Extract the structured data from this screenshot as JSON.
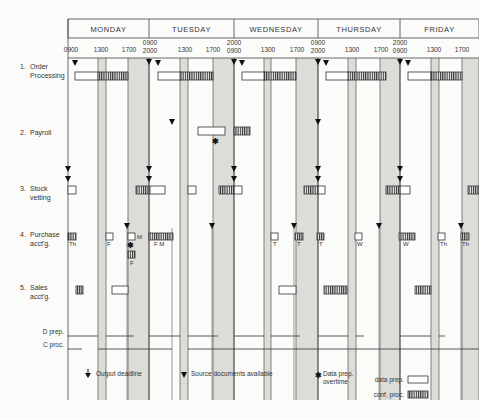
{
  "days": [
    {
      "label": "MONDAY",
      "x0": 68,
      "x1": 149
    },
    {
      "label": "TUESDAY",
      "x0": 149,
      "x1": 234
    },
    {
      "label": "WEDNESDAY",
      "x0": 234,
      "x1": 318
    },
    {
      "label": "THURSDAY",
      "x0": 318,
      "x1": 400
    },
    {
      "label": "FRIDAY",
      "x0": 400,
      "x1": 479
    }
  ],
  "time_labels": [
    {
      "x": 71,
      "y": 52,
      "text": "0900"
    },
    {
      "x": 101,
      "y": 52,
      "text": "1300"
    },
    {
      "x": 129,
      "y": 52,
      "text": "1700"
    },
    {
      "x": 150,
      "y": 45,
      "text": "0900"
    },
    {
      "x": 150,
      "y": 53,
      "text": "2000"
    },
    {
      "x": 185,
      "y": 52,
      "text": "1300"
    },
    {
      "x": 213,
      "y": 52,
      "text": "1700"
    },
    {
      "x": 234,
      "y": 45,
      "text": "2000"
    },
    {
      "x": 234,
      "y": 53,
      "text": "0900"
    },
    {
      "x": 268,
      "y": 52,
      "text": "1300"
    },
    {
      "x": 297,
      "y": 52,
      "text": "1700"
    },
    {
      "x": 318,
      "y": 45,
      "text": "0900"
    },
    {
      "x": 318,
      "y": 53,
      "text": "2000"
    },
    {
      "x": 352,
      "y": 52,
      "text": "1300"
    },
    {
      "x": 381,
      "y": 52,
      "text": "1700"
    },
    {
      "x": 400,
      "y": 45,
      "text": "2000"
    },
    {
      "x": 400,
      "y": 53,
      "text": "0900"
    },
    {
      "x": 434,
      "y": 52,
      "text": "1300"
    },
    {
      "x": 462,
      "y": 52,
      "text": "1700"
    }
  ],
  "shaded_bands": [
    {
      "x0": 98,
      "x1": 106
    },
    {
      "x0": 128,
      "x1": 149
    },
    {
      "x0": 180,
      "x1": 188
    },
    {
      "x0": 213,
      "x1": 234
    },
    {
      "x0": 264,
      "x1": 271
    },
    {
      "x0": 296,
      "x1": 318
    },
    {
      "x0": 348,
      "x1": 356
    },
    {
      "x0": 380,
      "x1": 400
    },
    {
      "x0": 431,
      "x1": 439
    },
    {
      "x0": 462,
      "x1": 479
    }
  ],
  "rows": [
    {
      "num": "1.",
      "line1": "Order",
      "line2": "Processing",
      "y": 66
    },
    {
      "num": "2.",
      "line1": "Payroll",
      "line2": "",
      "y": 132
    },
    {
      "num": "3.",
      "line1": "Stock",
      "line2": "vetting",
      "y": 188
    },
    {
      "num": "4.",
      "line1": "Purchase",
      "line2": "acct'g.",
      "y": 234
    },
    {
      "num": "5.",
      "line1": "Sales",
      "line2": "acct'g.",
      "y": 287
    }
  ],
  "resource_rows": [
    {
      "label": "D prep.",
      "y": 336
    },
    {
      "label": "C proc.",
      "y": 349
    }
  ],
  "data_prep_boxes": [
    {
      "x": 75,
      "y": 72,
      "w": 23,
      "h": 8
    },
    {
      "x": 158,
      "y": 72,
      "w": 23,
      "h": 8
    },
    {
      "x": 242,
      "y": 72,
      "w": 23,
      "h": 8
    },
    {
      "x": 326,
      "y": 72,
      "w": 23,
      "h": 8
    },
    {
      "x": 408,
      "y": 72,
      "w": 23,
      "h": 8
    },
    {
      "x": 198,
      "y": 127,
      "w": 27,
      "h": 8
    },
    {
      "x": 68,
      "y": 186,
      "w": 8,
      "h": 8
    },
    {
      "x": 150,
      "y": 186,
      "w": 15,
      "h": 8
    },
    {
      "x": 188,
      "y": 186,
      "w": 8,
      "h": 8
    },
    {
      "x": 234,
      "y": 186,
      "w": 8,
      "h": 8
    },
    {
      "x": 318,
      "y": 186,
      "w": 7,
      "h": 8
    },
    {
      "x": 400,
      "y": 186,
      "w": 10,
      "h": 8
    },
    {
      "x": 106,
      "y": 233,
      "w": 7,
      "h": 7
    },
    {
      "x": 128,
      "y": 233,
      "w": 7,
      "h": 7
    },
    {
      "x": 271,
      "y": 233,
      "w": 7,
      "h": 7
    },
    {
      "x": 355,
      "y": 233,
      "w": 7,
      "h": 7
    },
    {
      "x": 438,
      "y": 233,
      "w": 7,
      "h": 7
    },
    {
      "x": 112,
      "y": 286,
      "w": 16,
      "h": 8
    },
    {
      "x": 279,
      "y": 286,
      "w": 17,
      "h": 8
    }
  ],
  "conf_proc_boxes": [
    {
      "x": 98,
      "y": 72,
      "w": 30,
      "h": 8
    },
    {
      "x": 180,
      "y": 72,
      "w": 33,
      "h": 8
    },
    {
      "x": 264,
      "y": 72,
      "w": 32,
      "h": 8
    },
    {
      "x": 348,
      "y": 72,
      "w": 38,
      "h": 8
    },
    {
      "x": 431,
      "y": 72,
      "w": 31,
      "h": 8
    },
    {
      "x": 234,
      "y": 127,
      "w": 16,
      "h": 8
    },
    {
      "x": 136,
      "y": 186,
      "w": 13,
      "h": 8
    },
    {
      "x": 219,
      "y": 186,
      "w": 15,
      "h": 8
    },
    {
      "x": 304,
      "y": 186,
      "w": 14,
      "h": 8
    },
    {
      "x": 386,
      "y": 186,
      "w": 14,
      "h": 8
    },
    {
      "x": 468,
      "y": 186,
      "w": 11,
      "h": 8
    },
    {
      "x": 68,
      "y": 233,
      "w": 8,
      "h": 7
    },
    {
      "x": 149,
      "y": 233,
      "w": 24,
      "h": 7
    },
    {
      "x": 128,
      "y": 251,
      "w": 7,
      "h": 7
    },
    {
      "x": 295,
      "y": 233,
      "w": 8,
      "h": 7
    },
    {
      "x": 317,
      "y": 233,
      "w": 7,
      "h": 7
    },
    {
      "x": 399,
      "y": 233,
      "w": 16,
      "h": 7
    },
    {
      "x": 461,
      "y": 233,
      "w": 8,
      "h": 7
    },
    {
      "x": 76,
      "y": 286,
      "w": 7,
      "h": 8
    },
    {
      "x": 324,
      "y": 286,
      "w": 23,
      "h": 8
    },
    {
      "x": 415,
      "y": 286,
      "w": 16,
      "h": 8
    }
  ],
  "box_labels": [
    {
      "x": 69,
      "y": 246,
      "text": "Th"
    },
    {
      "x": 107,
      "y": 246,
      "text": "F"
    },
    {
      "x": 137,
      "y": 239,
      "text": "M"
    },
    {
      "x": 154,
      "y": 246,
      "text": "F M"
    },
    {
      "x": 130,
      "y": 265,
      "text": "F"
    },
    {
      "x": 273,
      "y": 246,
      "text": "T"
    },
    {
      "x": 297,
      "y": 246,
      "text": "T"
    },
    {
      "x": 319,
      "y": 246,
      "text": "T"
    },
    {
      "x": 357,
      "y": 246,
      "text": "W"
    },
    {
      "x": 403,
      "y": 246,
      "text": "W"
    },
    {
      "x": 440,
      "y": 246,
      "text": "Th"
    },
    {
      "x": 462,
      "y": 246,
      "text": "Th"
    }
  ],
  "source_triangles": [
    {
      "x": 75,
      "y": 63
    },
    {
      "x": 158,
      "y": 63
    },
    {
      "x": 242,
      "y": 63
    },
    {
      "x": 326,
      "y": 63
    },
    {
      "x": 408,
      "y": 63
    },
    {
      "x": 172,
      "y": 122
    },
    {
      "x": 127,
      "y": 226
    },
    {
      "x": 212,
      "y": 226
    },
    {
      "x": 294,
      "y": 226
    },
    {
      "x": 379,
      "y": 226
    },
    {
      "x": 461,
      "y": 226
    }
  ],
  "deadline_lines": [
    {
      "x": 68,
      "y0": 58,
      "y1": 400
    },
    {
      "x": 149,
      "y0": 58,
      "y1": 400
    },
    {
      "x": 234,
      "y0": 58,
      "y1": 400
    },
    {
      "x": 318,
      "y0": 58,
      "y1": 400
    },
    {
      "x": 400,
      "y0": 58,
      "y1": 400
    }
  ],
  "deadline_arrows": [
    {
      "x": 149,
      "y": 62
    },
    {
      "x": 234,
      "y": 62
    },
    {
      "x": 318,
      "y": 62
    },
    {
      "x": 400,
      "y": 62
    },
    {
      "x": 318,
      "y": 122
    },
    {
      "x": 68,
      "y": 169
    },
    {
      "x": 68,
      "y": 179
    },
    {
      "x": 149,
      "y": 169
    },
    {
      "x": 149,
      "y": 179
    },
    {
      "x": 234,
      "y": 169
    },
    {
      "x": 234,
      "y": 179
    },
    {
      "x": 318,
      "y": 169
    },
    {
      "x": 318,
      "y": 179
    },
    {
      "x": 400,
      "y": 169
    },
    {
      "x": 400,
      "y": 179
    }
  ],
  "overtime_marks": [
    {
      "x": 215,
      "y": 141
    },
    {
      "x": 130,
      "y": 245
    }
  ],
  "d_prep_segments": [
    [
      68,
      98
    ],
    [
      106,
      134
    ],
    [
      149,
      180
    ],
    [
      188,
      218
    ],
    [
      234,
      264
    ],
    [
      271,
      300
    ],
    [
      318,
      348
    ],
    [
      356,
      364
    ],
    [
      400,
      431
    ],
    [
      439,
      445
    ]
  ],
  "c_proc_segments": [
    [
      68,
      82
    ],
    [
      98,
      172
    ],
    [
      188,
      479
    ]
  ],
  "legend": {
    "output_deadline": "Output deadline",
    "source_docs": "Source documents available",
    "overtime_1": "Data prep.",
    "overtime_2": "overtime",
    "data_prep": "data prep.",
    "conf_proc": "conf. proc."
  }
}
